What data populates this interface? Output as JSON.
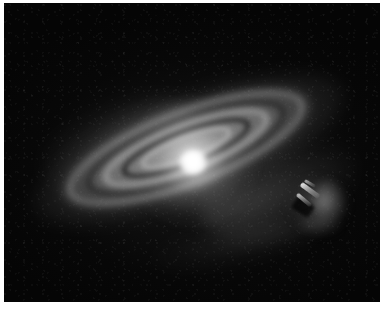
{
  "page": {
    "background_color": "#ffffff",
    "width": 384,
    "height": 318
  },
  "frame": {
    "name": "astronomical-image-frame",
    "background_color": "#050505",
    "left": 4,
    "top": 3,
    "width": 376,
    "height": 299,
    "border_color": "#ffffff"
  },
  "scene": {
    "type": "circumstellar-debris-disk",
    "description": "Inclined circumstellar debris disk with bright central star, nested concentric rings separated by dark gaps, and a bright angular companion knot at the right edge of the disk.",
    "disk_position_angle_deg": -21,
    "colors": {
      "sky": "#050505",
      "star_core": "#ffffff",
      "disk_bright": "#d7d7d7",
      "disk_mid": "#8c8c8c",
      "gap_dark": "#060606",
      "companion_bright": "#ffffff"
    }
  },
  "features": [
    {
      "name": "central-star",
      "label": "Central star",
      "center_x": 193,
      "center_y": 162,
      "brightness": "saturated-white"
    },
    {
      "name": "inner-ring",
      "label": "Inner bright ring",
      "semimajor_px": 88,
      "semiminor_px": 25
    },
    {
      "name": "inner-gap",
      "label": "Inner dark gap",
      "semimajor_px": 69,
      "semiminor_px": 19
    },
    {
      "name": "outer-ring",
      "label": "Outer bright ring",
      "semimajor_px": 126,
      "semiminor_px": 38
    },
    {
      "name": "outer-gap",
      "label": "Outer dark gap",
      "semimajor_px": 107,
      "semiminor_px": 31
    },
    {
      "name": "disk-halo",
      "label": "Extended disk halo",
      "semimajor_px": 165,
      "semiminor_px": 52
    },
    {
      "name": "companion-knot",
      "label": "Bright angular companion knot",
      "center_x": 318,
      "center_y": 205
    },
    {
      "name": "northeast-plume",
      "label": "Northeast scattered-light extension"
    },
    {
      "name": "southwest-plume",
      "label": "Southwest scattered-light extension"
    }
  ]
}
